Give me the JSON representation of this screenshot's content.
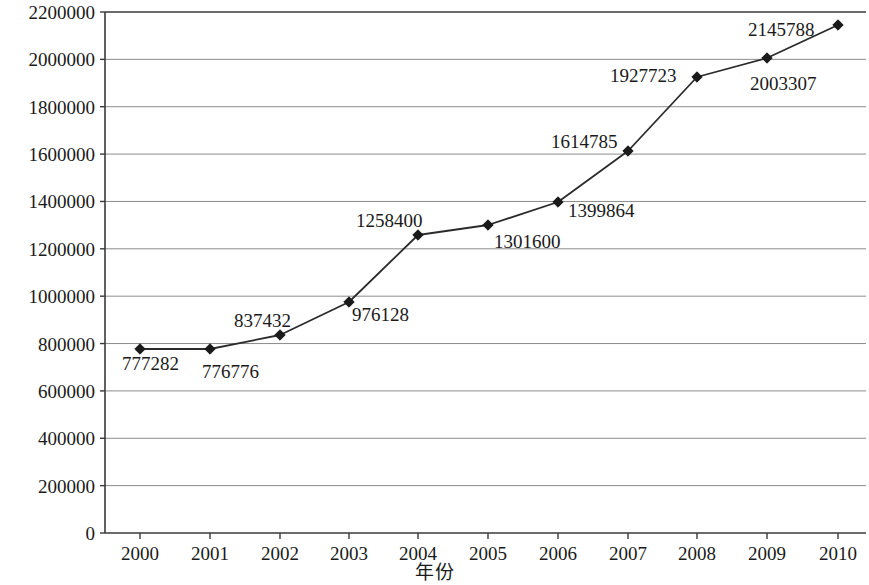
{
  "chart_data": {
    "type": "line",
    "title": "",
    "xlabel": "年份",
    "ylabel": "全部从业人员年平均人数（人）",
    "categories": [
      "2000",
      "2001",
      "2002",
      "2003",
      "2004",
      "2005",
      "2006",
      "2007",
      "2008",
      "2009",
      "2010"
    ],
    "values": [
      777282,
      776776,
      837432,
      976128,
      1258400,
      1301600,
      1399864,
      1614785,
      1927723,
      2003307,
      2145788
    ],
    "point_labels": [
      "777282",
      "776776",
      "837432",
      "976128",
      "1258400",
      "1301600",
      "1399864",
      "1614785",
      "1927723",
      "2003307",
      "2145788"
    ],
    "ylim": [
      0,
      2200000
    ],
    "ytick_labels": [
      "0",
      "200000",
      "400000",
      "600000",
      "800000",
      "1000000",
      "1200000",
      "1400000",
      "1600000",
      "1800000",
      "2000000",
      "2200000"
    ],
    "ytick_values": [
      0,
      200000,
      400000,
      600000,
      800000,
      1000000,
      1200000,
      1400000,
      1600000,
      1800000,
      2000000,
      2200000
    ],
    "grid": true,
    "legend": "none",
    "series_color": "#2b2b2b",
    "marker": "diamond",
    "marker_color": "#1a1a1a",
    "gridline_color": "#8c8c8c",
    "axis_color": "#3a3a3a",
    "background_color": "#ffffff",
    "label_color": "#1a1a1a"
  },
  "layout": {
    "plot_left": 105,
    "plot_right": 866,
    "plot_top": 12,
    "plot_bottom": 533,
    "point_x": [
      140,
      210,
      280,
      349,
      418,
      488,
      558,
      628,
      697,
      767,
      838
    ],
    "point_y": [
      349,
      349,
      335,
      302,
      235,
      225,
      202,
      151,
      77,
      58,
      25
    ],
    "label_positions": [
      {
        "x": 122,
        "y": 370,
        "anchor": "start"
      },
      {
        "x": 202,
        "y": 378,
        "anchor": "start"
      },
      {
        "x": 234,
        "y": 327,
        "anchor": "start"
      },
      {
        "x": 352,
        "y": 321,
        "anchor": "start"
      },
      {
        "x": 356,
        "y": 227,
        "anchor": "start"
      },
      {
        "x": 494,
        "y": 248,
        "anchor": "start"
      },
      {
        "x": 568,
        "y": 217,
        "anchor": "start"
      },
      {
        "x": 551,
        "y": 148,
        "anchor": "start"
      },
      {
        "x": 610,
        "y": 82,
        "anchor": "start"
      },
      {
        "x": 750,
        "y": 90,
        "anchor": "start"
      },
      {
        "x": 748,
        "y": 36,
        "anchor": "start"
      }
    ]
  }
}
